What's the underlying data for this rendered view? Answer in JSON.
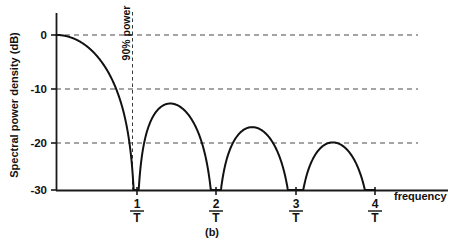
{
  "figure": {
    "caption": "(b)",
    "y_axis_title": "Spectral power density (dB)",
    "x_axis_title": "frequency",
    "annotation_label": "90% power"
  },
  "chart_data": {
    "type": "line",
    "title": "",
    "subtitle": "",
    "caption": "(b)",
    "xlabel": "frequency",
    "ylabel": "Spectral power density (dB)",
    "xlim": [
      0,
      4.55
    ],
    "ylim": [
      -30,
      1.5
    ],
    "x_tick_labels": [
      "1/T",
      "2/T",
      "3/T",
      "4/T"
    ],
    "x_tick_numerators": [
      "1",
      "2",
      "3",
      "4"
    ],
    "x_tick_denominators": [
      "T",
      "T",
      "T",
      "T"
    ],
    "x_tick_values": [
      1,
      2,
      3,
      4
    ],
    "y_tick_labels": [
      "0",
      "-10",
      "-20",
      "-30"
    ],
    "y_tick_values": [
      0,
      -10,
      -20,
      -30
    ],
    "grid": "horizontal dashed at 0, -10, -20 dB",
    "gridlines_y": [
      0,
      -10,
      -20
    ],
    "legend": "none",
    "series": [
      {
        "name": "sinc-squared spectral power density",
        "description": "10*log10(sinc(f*T)^2), main lobe peak 0 dB at f=0, nulls at integer multiples of 1/T",
        "x": [
          0,
          0.1,
          0.2,
          0.3,
          0.4,
          0.5,
          0.6,
          0.7,
          0.8,
          0.9,
          0.95,
          1.0,
          1.1,
          1.2,
          1.3,
          1.43,
          1.5,
          1.6,
          1.7,
          1.8,
          1.9,
          1.95,
          2.0,
          2.1,
          2.2,
          2.3,
          2.46,
          2.6,
          2.7,
          2.8,
          2.9,
          2.95,
          3.0,
          3.1,
          3.2,
          3.3,
          3.47,
          3.6,
          3.7,
          3.8,
          3.9,
          3.95,
          4.0
        ],
        "y": [
          0,
          -0.14,
          -0.58,
          -1.36,
          -2.55,
          -3.92,
          -5.97,
          -8.62,
          -12.25,
          -18.0,
          -23.2,
          -30,
          -21.0,
          -15.6,
          -13.7,
          -13.26,
          -13.46,
          -15.0,
          -17.6,
          -21.2,
          -26.5,
          -29.0,
          -30,
          -25.5,
          -21.5,
          -19.2,
          -17.9,
          -19.2,
          -20.6,
          -23.0,
          -27.0,
          -29.2,
          -30,
          -26.6,
          -23.5,
          -21.9,
          -20.83,
          -21.8,
          -23.0,
          -24.8,
          -27.8,
          -29.3,
          -30
        ]
      }
    ],
    "annotations": [
      {
        "text": "90% power",
        "x": 0.94,
        "type": "vertical-dashed-line",
        "y_from": 1.0,
        "y_to": -30,
        "note": "vertical dashed line just left of the first null at 1/T, labeled with rotated text"
      }
    ],
    "sidelobe_peaks_db": [
      -13.26,
      -17.9,
      -20.83
    ],
    "sidelobe_peak_positions": [
      1.43,
      2.46,
      3.47
    ],
    "nulls": [
      1,
      2,
      3,
      4
    ],
    "colors": {
      "curve": "#111111",
      "axis": "#1a1a1a",
      "grid": "#4a4a4a",
      "background": "#ffffff"
    }
  }
}
